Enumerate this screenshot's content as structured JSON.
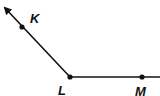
{
  "diagram": {
    "type": "angle",
    "points": [
      {
        "name": "K",
        "label": "K",
        "x": 22,
        "y": 27,
        "label_x": 31,
        "label_y": 23
      },
      {
        "name": "L",
        "label": "L",
        "x": 70,
        "y": 77,
        "label_x": 58,
        "label_y": 95
      },
      {
        "name": "M",
        "label": "M",
        "x": 142,
        "y": 77,
        "label_x": 135,
        "label_y": 96
      }
    ],
    "rays": [
      {
        "from": "L",
        "through": "K",
        "arrow": true
      },
      {
        "from": "L",
        "through": "M",
        "arrow": false
      }
    ],
    "colors": {
      "line": "#111111",
      "background": "#ffffff"
    }
  }
}
